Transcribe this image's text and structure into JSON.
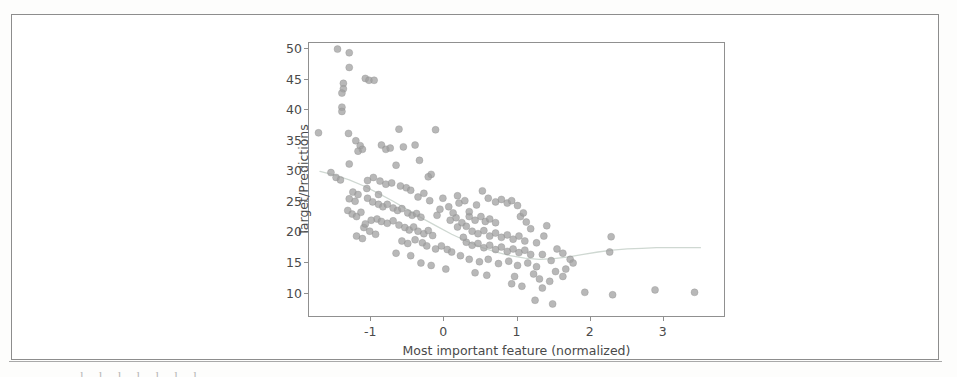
{
  "page": {
    "background_color": "#ffffff",
    "frame_color": "#8d8d8d",
    "bottom_text_sliver": "l l l l l l l"
  },
  "chart_data": {
    "type": "scatter",
    "title": "",
    "subtitle": "",
    "xlabel": "Most important feature (normalized)",
    "ylabel": "Target/Predictions",
    "xlim": [
      -1.85,
      3.85
    ],
    "ylim": [
      6.0,
      51.0
    ],
    "xticks": [
      -1,
      0,
      1,
      2,
      3
    ],
    "xticklabels": [
      "-1",
      "0",
      "1",
      "2",
      "3"
    ],
    "yticks": [
      10,
      15,
      20,
      25,
      30,
      35,
      40,
      45,
      50
    ],
    "yticklabels": [
      "10",
      "15",
      "20",
      "25",
      "30",
      "35",
      "40",
      "45",
      "50"
    ],
    "grid": false,
    "legend": false,
    "legend_position": "none",
    "marker": {
      "shape": "circle",
      "color": "#a0a0a0",
      "edge_color": "#8e8e8e",
      "size": 7,
      "alpha": 0.75
    },
    "trend_line": {
      "name": "smoothed fit",
      "color": "#cfd8d2",
      "width": 1.3,
      "style": "solid",
      "x": [
        -1.7,
        -1.5,
        -1.3,
        -1.1,
        -0.9,
        -0.7,
        -0.5,
        -0.3,
        -0.1,
        0.1,
        0.3,
        0.5,
        0.7,
        0.9,
        1.1,
        1.3,
        1.5,
        1.7,
        1.9,
        2.1,
        2.3,
        2.5,
        2.7,
        2.9,
        3.1,
        3.3,
        3.5
      ],
      "y": [
        30.0,
        29.4,
        28.6,
        27.6,
        26.4,
        25.1,
        23.7,
        22.3,
        21.0,
        19.7,
        18.6,
        17.6,
        16.8,
        16.2,
        15.8,
        15.6,
        15.7,
        16.0,
        16.4,
        16.8,
        17.1,
        17.3,
        17.4,
        17.5,
        17.5,
        17.5,
        17.5
      ]
    },
    "points": [
      {
        "x": -1.46,
        "y": 50.0
      },
      {
        "x": -1.3,
        "y": 49.4
      },
      {
        "x": -1.3,
        "y": 47.0
      },
      {
        "x": -1.08,
        "y": 45.2
      },
      {
        "x": -1.03,
        "y": 44.9
      },
      {
        "x": -0.96,
        "y": 44.9
      },
      {
        "x": -1.38,
        "y": 44.4
      },
      {
        "x": -1.38,
        "y": 43.5
      },
      {
        "x": -1.4,
        "y": 42.8
      },
      {
        "x": -1.4,
        "y": 40.5
      },
      {
        "x": -1.4,
        "y": 39.8
      },
      {
        "x": -1.72,
        "y": 36.3
      },
      {
        "x": -1.31,
        "y": 36.2
      },
      {
        "x": -0.62,
        "y": 36.9
      },
      {
        "x": -0.12,
        "y": 36.8
      },
      {
        "x": -1.21,
        "y": 35.0
      },
      {
        "x": -1.15,
        "y": 34.2
      },
      {
        "x": -1.12,
        "y": 33.6
      },
      {
        "x": -1.18,
        "y": 33.3
      },
      {
        "x": -0.86,
        "y": 34.3
      },
      {
        "x": -0.8,
        "y": 33.6
      },
      {
        "x": -0.74,
        "y": 33.8
      },
      {
        "x": -0.56,
        "y": 34.0
      },
      {
        "x": -0.4,
        "y": 34.3
      },
      {
        "x": -1.3,
        "y": 31.2
      },
      {
        "x": -0.66,
        "y": 31.0
      },
      {
        "x": -0.34,
        "y": 31.8
      },
      {
        "x": -0.18,
        "y": 29.5
      },
      {
        "x": -0.22,
        "y": 29.1
      },
      {
        "x": -1.55,
        "y": 29.8
      },
      {
        "x": -1.48,
        "y": 29.0
      },
      {
        "x": -1.42,
        "y": 28.6
      },
      {
        "x": -1.05,
        "y": 28.5
      },
      {
        "x": -0.97,
        "y": 29.0
      },
      {
        "x": -0.88,
        "y": 28.4
      },
      {
        "x": -0.8,
        "y": 27.9
      },
      {
        "x": -0.72,
        "y": 28.1
      },
      {
        "x": -0.6,
        "y": 27.6
      },
      {
        "x": -0.52,
        "y": 27.3
      },
      {
        "x": -0.46,
        "y": 26.9
      },
      {
        "x": -1.25,
        "y": 26.6
      },
      {
        "x": -1.18,
        "y": 26.2
      },
      {
        "x": -1.3,
        "y": 25.5
      },
      {
        "x": -1.22,
        "y": 25.1
      },
      {
        "x": -1.05,
        "y": 25.6
      },
      {
        "x": -0.98,
        "y": 25.0
      },
      {
        "x": -0.9,
        "y": 24.6
      },
      {
        "x": -0.84,
        "y": 24.2
      },
      {
        "x": -0.78,
        "y": 24.6
      },
      {
        "x": -0.7,
        "y": 24.0
      },
      {
        "x": -0.64,
        "y": 23.6
      },
      {
        "x": -0.58,
        "y": 23.9
      },
      {
        "x": -0.5,
        "y": 23.2
      },
      {
        "x": -0.44,
        "y": 22.8
      },
      {
        "x": -0.38,
        "y": 23.1
      },
      {
        "x": -0.32,
        "y": 22.5
      },
      {
        "x": -1.32,
        "y": 23.6
      },
      {
        "x": -1.26,
        "y": 23.0
      },
      {
        "x": -1.2,
        "y": 22.6
      },
      {
        "x": -1.14,
        "y": 23.3
      },
      {
        "x": -0.92,
        "y": 22.2
      },
      {
        "x": -0.86,
        "y": 21.8
      },
      {
        "x": -0.78,
        "y": 21.5
      },
      {
        "x": -0.7,
        "y": 21.9
      },
      {
        "x": -0.62,
        "y": 21.2
      },
      {
        "x": -0.54,
        "y": 20.8
      },
      {
        "x": -0.48,
        "y": 20.4
      },
      {
        "x": -0.42,
        "y": 20.9
      },
      {
        "x": -0.36,
        "y": 20.2
      },
      {
        "x": -0.28,
        "y": 19.8
      },
      {
        "x": -0.22,
        "y": 20.3
      },
      {
        "x": -0.16,
        "y": 19.5
      },
      {
        "x": -1.1,
        "y": 20.8
      },
      {
        "x": -1.02,
        "y": 20.2
      },
      {
        "x": -0.94,
        "y": 19.7
      },
      {
        "x": -1.2,
        "y": 19.4
      },
      {
        "x": -1.12,
        "y": 19.0
      },
      {
        "x": -0.58,
        "y": 18.6
      },
      {
        "x": -0.5,
        "y": 18.2
      },
      {
        "x": -0.4,
        "y": 18.8
      },
      {
        "x": -0.3,
        "y": 18.3
      },
      {
        "x": -0.24,
        "y": 17.8
      },
      {
        "x": -0.12,
        "y": 17.3
      },
      {
        "x": -0.04,
        "y": 17.8
      },
      {
        "x": 0.04,
        "y": 17.2
      },
      {
        "x": 0.1,
        "y": 16.8
      },
      {
        "x": -0.66,
        "y": 16.6
      },
      {
        "x": -0.46,
        "y": 16.2
      },
      {
        "x": -0.32,
        "y": 15.0
      },
      {
        "x": -0.18,
        "y": 14.6
      },
      {
        "x": 0.02,
        "y": 14.0
      },
      {
        "x": 0.18,
        "y": 20.9
      },
      {
        "x": 0.24,
        "y": 21.6
      },
      {
        "x": 0.3,
        "y": 21.0
      },
      {
        "x": 0.16,
        "y": 22.4
      },
      {
        "x": 0.08,
        "y": 22.0
      },
      {
        "x": 0.34,
        "y": 22.6
      },
      {
        "x": 0.42,
        "y": 22.0
      },
      {
        "x": 0.5,
        "y": 22.6
      },
      {
        "x": 0.56,
        "y": 21.8
      },
      {
        "x": 0.62,
        "y": 22.2
      },
      {
        "x": 0.7,
        "y": 21.6
      },
      {
        "x": 0.2,
        "y": 24.8
      },
      {
        "x": 0.28,
        "y": 25.2
      },
      {
        "x": 0.44,
        "y": 24.5
      },
      {
        "x": 0.18,
        "y": 26.0
      },
      {
        "x": 0.52,
        "y": 26.8
      },
      {
        "x": 0.6,
        "y": 25.6
      },
      {
        "x": 0.7,
        "y": 25.0
      },
      {
        "x": 0.78,
        "y": 25.4
      },
      {
        "x": 0.86,
        "y": 24.8
      },
      {
        "x": 0.92,
        "y": 25.2
      },
      {
        "x": 1.0,
        "y": 24.4
      },
      {
        "x": 0.38,
        "y": 20.2
      },
      {
        "x": 0.46,
        "y": 19.8
      },
      {
        "x": 0.54,
        "y": 20.3
      },
      {
        "x": 0.62,
        "y": 19.4
      },
      {
        "x": 0.7,
        "y": 19.9
      },
      {
        "x": 0.78,
        "y": 19.2
      },
      {
        "x": 0.86,
        "y": 19.6
      },
      {
        "x": 0.94,
        "y": 18.9
      },
      {
        "x": 1.02,
        "y": 19.4
      },
      {
        "x": 1.1,
        "y": 18.6
      },
      {
        "x": 0.3,
        "y": 18.4
      },
      {
        "x": 0.38,
        "y": 17.9
      },
      {
        "x": 0.46,
        "y": 18.2
      },
      {
        "x": 0.54,
        "y": 17.5
      },
      {
        "x": 0.62,
        "y": 17.9
      },
      {
        "x": 0.7,
        "y": 17.2
      },
      {
        "x": 0.78,
        "y": 17.6
      },
      {
        "x": 0.86,
        "y": 16.9
      },
      {
        "x": 0.94,
        "y": 17.3
      },
      {
        "x": 1.02,
        "y": 16.7
      },
      {
        "x": 1.1,
        "y": 17.1
      },
      {
        "x": 1.18,
        "y": 16.4
      },
      {
        "x": 0.22,
        "y": 16.2
      },
      {
        "x": 0.34,
        "y": 15.6
      },
      {
        "x": 0.48,
        "y": 15.2
      },
      {
        "x": 0.6,
        "y": 15.6
      },
      {
        "x": 0.74,
        "y": 14.9
      },
      {
        "x": 0.88,
        "y": 15.3
      },
      {
        "x": 1.0,
        "y": 14.6
      },
      {
        "x": 1.14,
        "y": 15.0
      },
      {
        "x": 1.26,
        "y": 14.4
      },
      {
        "x": 0.42,
        "y": 13.4
      },
      {
        "x": 0.58,
        "y": 13.0
      },
      {
        "x": 0.96,
        "y": 12.8
      },
      {
        "x": 1.22,
        "y": 13.2
      },
      {
        "x": 1.3,
        "y": 12.4
      },
      {
        "x": 1.44,
        "y": 12.0
      },
      {
        "x": 1.34,
        "y": 10.9
      },
      {
        "x": 1.24,
        "y": 8.9
      },
      {
        "x": 1.48,
        "y": 8.3
      },
      {
        "x": 0.92,
        "y": 11.6
      },
      {
        "x": 1.06,
        "y": 11.2
      },
      {
        "x": 1.4,
        "y": 21.1
      },
      {
        "x": 1.36,
        "y": 19.4
      },
      {
        "x": 1.26,
        "y": 18.3
      },
      {
        "x": 1.18,
        "y": 20.6
      },
      {
        "x": 1.12,
        "y": 21.7
      },
      {
        "x": 1.04,
        "y": 22.6
      },
      {
        "x": 1.08,
        "y": 23.2
      },
      {
        "x": 1.54,
        "y": 17.3
      },
      {
        "x": 1.62,
        "y": 16.6
      },
      {
        "x": 1.72,
        "y": 15.6
      },
      {
        "x": 1.76,
        "y": 15.0
      },
      {
        "x": 1.66,
        "y": 14.0
      },
      {
        "x": 1.52,
        "y": 13.6
      },
      {
        "x": 1.62,
        "y": 12.8
      },
      {
        "x": 2.28,
        "y": 19.3
      },
      {
        "x": 2.26,
        "y": 16.8
      },
      {
        "x": 1.92,
        "y": 10.2
      },
      {
        "x": 2.3,
        "y": 9.8
      },
      {
        "x": 2.88,
        "y": 10.6
      },
      {
        "x": 3.42,
        "y": 10.2
      },
      {
        "x": -0.06,
        "y": 23.8
      },
      {
        "x": 0.06,
        "y": 24.2
      },
      {
        "x": -0.02,
        "y": 25.6
      },
      {
        "x": 0.12,
        "y": 23.2
      },
      {
        "x": -0.1,
        "y": 22.8
      },
      {
        "x": -1.0,
        "y": 22.0
      },
      {
        "x": -1.08,
        "y": 21.4
      },
      {
        "x": -0.9,
        "y": 26.2
      },
      {
        "x": -1.06,
        "y": 27.2
      },
      {
        "x": -0.36,
        "y": 25.8
      },
      {
        "x": -0.28,
        "y": 26.4
      },
      {
        "x": -0.2,
        "y": 25.2
      },
      {
        "x": 0.26,
        "y": 19.2
      },
      {
        "x": 0.34,
        "y": 23.4
      },
      {
        "x": 1.46,
        "y": 15.4
      },
      {
        "x": 1.34,
        "y": 16.4
      }
    ]
  },
  "axis_label_color": "#4a4a4a",
  "axis_line_color": "#909090"
}
